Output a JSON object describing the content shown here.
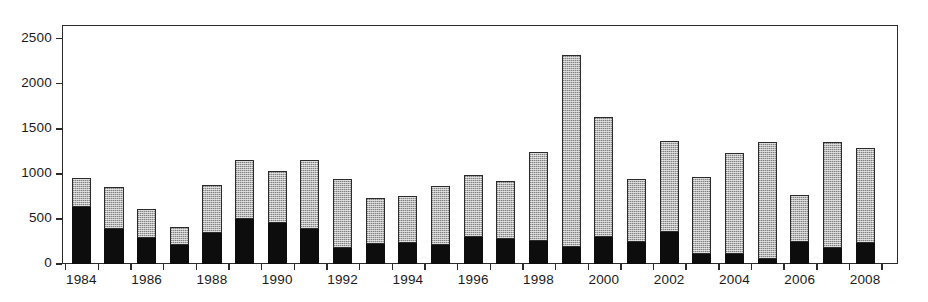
{
  "chart_data": {
    "type": "bar",
    "subtype": "stacked-bar",
    "title": "",
    "subtitle": "",
    "xlabel": "",
    "ylabel": "",
    "grid": false,
    "legend": null,
    "legend_position": "none",
    "ylim": [
      0,
      2650
    ],
    "ytick_values": [
      0,
      500,
      1000,
      1500,
      2000,
      2500
    ],
    "ytick_labels": [
      "0",
      "500",
      "1000",
      "1500",
      "2000",
      "2500"
    ],
    "categories": [
      "1984",
      "1985",
      "1986",
      "1987",
      "1988",
      "1989",
      "1990",
      "1991",
      "1992",
      "1993",
      "1994",
      "1995",
      "1996",
      "1997",
      "1998",
      "1999",
      "2000",
      "2001",
      "2002",
      "2003",
      "2004",
      "2005",
      "2006",
      "2007",
      "2008"
    ],
    "xtick_labels": [
      "1984",
      "1986",
      "1988",
      "1990",
      "1992",
      "1994",
      "1996",
      "1998",
      "2000",
      "2002",
      "2004",
      "2006",
      "2008"
    ],
    "series": [
      {
        "name": "lower-segment",
        "color": "#0d0d0d",
        "fill": "solid-black",
        "values": [
          630,
          390,
          285,
          215,
          345,
          500,
          455,
          385,
          175,
          220,
          230,
          215,
          305,
          275,
          250,
          190,
          300,
          245,
          350,
          115,
          110,
          55,
          240,
          180,
          235
        ]
      },
      {
        "name": "upper-segment",
        "color": "#b5b5b5",
        "fill": "gray-stipple",
        "values": [
          325,
          465,
          325,
          195,
          530,
          650,
          580,
          765,
          770,
          515,
          520,
          655,
          685,
          640,
          995,
          2130,
          1325,
          700,
          1015,
          845,
          1120,
          1300,
          520,
          1170,
          1055
        ]
      }
    ],
    "totals": [
      955,
      855,
      610,
      410,
      875,
      1150,
      1035,
      1150,
      945,
      735,
      750,
      870,
      990,
      915,
      1245,
      2320,
      1625,
      945,
      1365,
      960,
      1230,
      1355,
      760,
      1350,
      1290
    ]
  },
  "figure": {
    "background": "#ffffff",
    "axis_color": "#2b2b2b",
    "text_color": "#1a1a1a"
  }
}
